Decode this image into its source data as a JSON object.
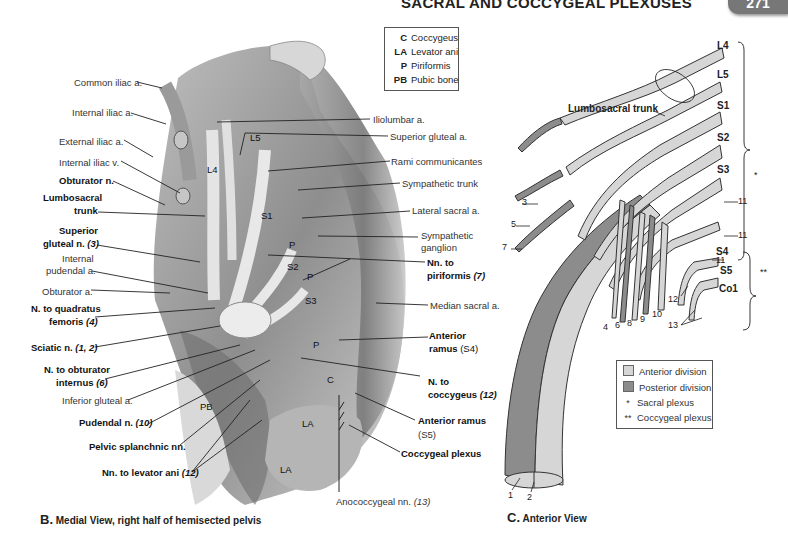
{
  "header": {
    "title": "SACRAL AND COCCYGEAL PLEXUSES",
    "page_number": "271"
  },
  "figure_b": {
    "caption_letter": "B.",
    "caption": "Medial View, right half of hemisected pelvis",
    "legend": [
      {
        "key": "C",
        "label": "Coccygeus"
      },
      {
        "key": "LA",
        "label": "Levator ani"
      },
      {
        "key": "P",
        "label": "Piriformis"
      },
      {
        "key": "PB",
        "label": "Pubic bone"
      }
    ],
    "left_labels": {
      "common_iliac_a": "Common iliac a.",
      "internal_iliac_a": "Internal iliac a.",
      "external_iliac_a": "External iliac a.",
      "internal_iliac_v": "Internal iliac v.",
      "obturator_n": "Obturator n.",
      "lumbosacral_trunk_1": "Lumbosacral",
      "lumbosacral_trunk_2": "trunk",
      "superior_gluteal_n_1": "Superior",
      "superior_gluteal_n_2": "gluteal n.",
      "superior_gluteal_n_num": "(3)",
      "internal_pudendal_a_1": "Internal",
      "internal_pudendal_a_2": "pudendal a.",
      "obturator_a": "Obturator a.",
      "n_quadratus_1": "N. to quadratus",
      "n_quadratus_2": "femoris",
      "n_quadratus_num": "(4)",
      "sciatic_n": "Sciatic n.",
      "sciatic_n_num": "(1, 2)",
      "n_obturator_int_1": "N. to obturator",
      "n_obturator_int_2": "internus",
      "n_obturator_int_num": "(6)",
      "inferior_gluteal_a": "Inferior gluteal a.",
      "pudendal_n": "Pudendal n.",
      "pudendal_n_num": "(10)",
      "pelvic_splanchnic": "Pelvic splanchnic nn.",
      "nn_levator_ani": "Nn. to levator ani",
      "nn_levator_ani_num": "(12)"
    },
    "right_labels": {
      "iliolumbar_a": "Iliolumbar a.",
      "superior_gluteal_a": "Superior gluteal a.",
      "rami_communicantes": "Rami communicantes",
      "sympathetic_trunk": "Sympathetic trunk",
      "lateral_sacral_a": "Lateral sacral a.",
      "sympathetic_ganglion_1": "Sympathetic",
      "sympathetic_ganglion_2": "ganglion",
      "nn_piriformis_1": "Nn. to",
      "nn_piriformis_2": "piriformis",
      "nn_piriformis_num": "(7)",
      "median_sacral_a": "Median sacral a.",
      "anterior_ramus_s4_1": "Anterior",
      "anterior_ramus_s4_2": "ramus",
      "anterior_ramus_s4_num": "(S4)",
      "n_coccygeus_1": "N. to",
      "n_coccygeus_2": "coccygeus",
      "n_coccygeus_num": "(12)",
      "anterior_ramus_s5_1": "Anterior ramus",
      "anterior_ramus_s5_num": "(S5)",
      "coccygeal_plexus": "Coccygeal plexus",
      "anococcygeal_nn": "Anococcygeal nn.",
      "anococcygeal_nn_num": "(13)"
    },
    "in_figure_labels": {
      "L5": "L5",
      "L4": "L4",
      "S1": "S1",
      "S2": "S2",
      "S3": "S3",
      "P1": "P",
      "P2": "P",
      "P3": "P",
      "C": "C",
      "PB": "PB",
      "LA1": "LA",
      "LA2": "LA"
    }
  },
  "figure_c": {
    "caption_letter": "C.",
    "caption": "Anterior View",
    "lumbosacral_trunk": "Lumbosacral trunk",
    "roots": [
      "L4",
      "L5",
      "S1",
      "S2",
      "S3",
      "S4",
      "S5",
      "Co1"
    ],
    "bracket_sacral": "*",
    "bracket_coccygeal": "**",
    "numbers": {
      "n1": "1",
      "n2": "2",
      "n3": "3",
      "n4": "4",
      "n5": "5",
      "n6": "6",
      "n7": "7",
      "n8": "8",
      "n9": "9",
      "n10": "10",
      "n11a": "11",
      "n11b": "11",
      "n11c": "11",
      "n12": "12",
      "n13": "13"
    },
    "legend": [
      {
        "swatch": "#d6d6d6",
        "label": "Anterior division"
      },
      {
        "swatch": "#8c8c8c",
        "label": "Posterior division"
      },
      {
        "symbol": "*",
        "label": "Sacral plexus"
      },
      {
        "symbol": "**",
        "label": "Coccygeal plexus"
      }
    ],
    "colors": {
      "anterior": "#d6d6d6",
      "posterior": "#8c8c8c",
      "outline": "#333333"
    }
  }
}
